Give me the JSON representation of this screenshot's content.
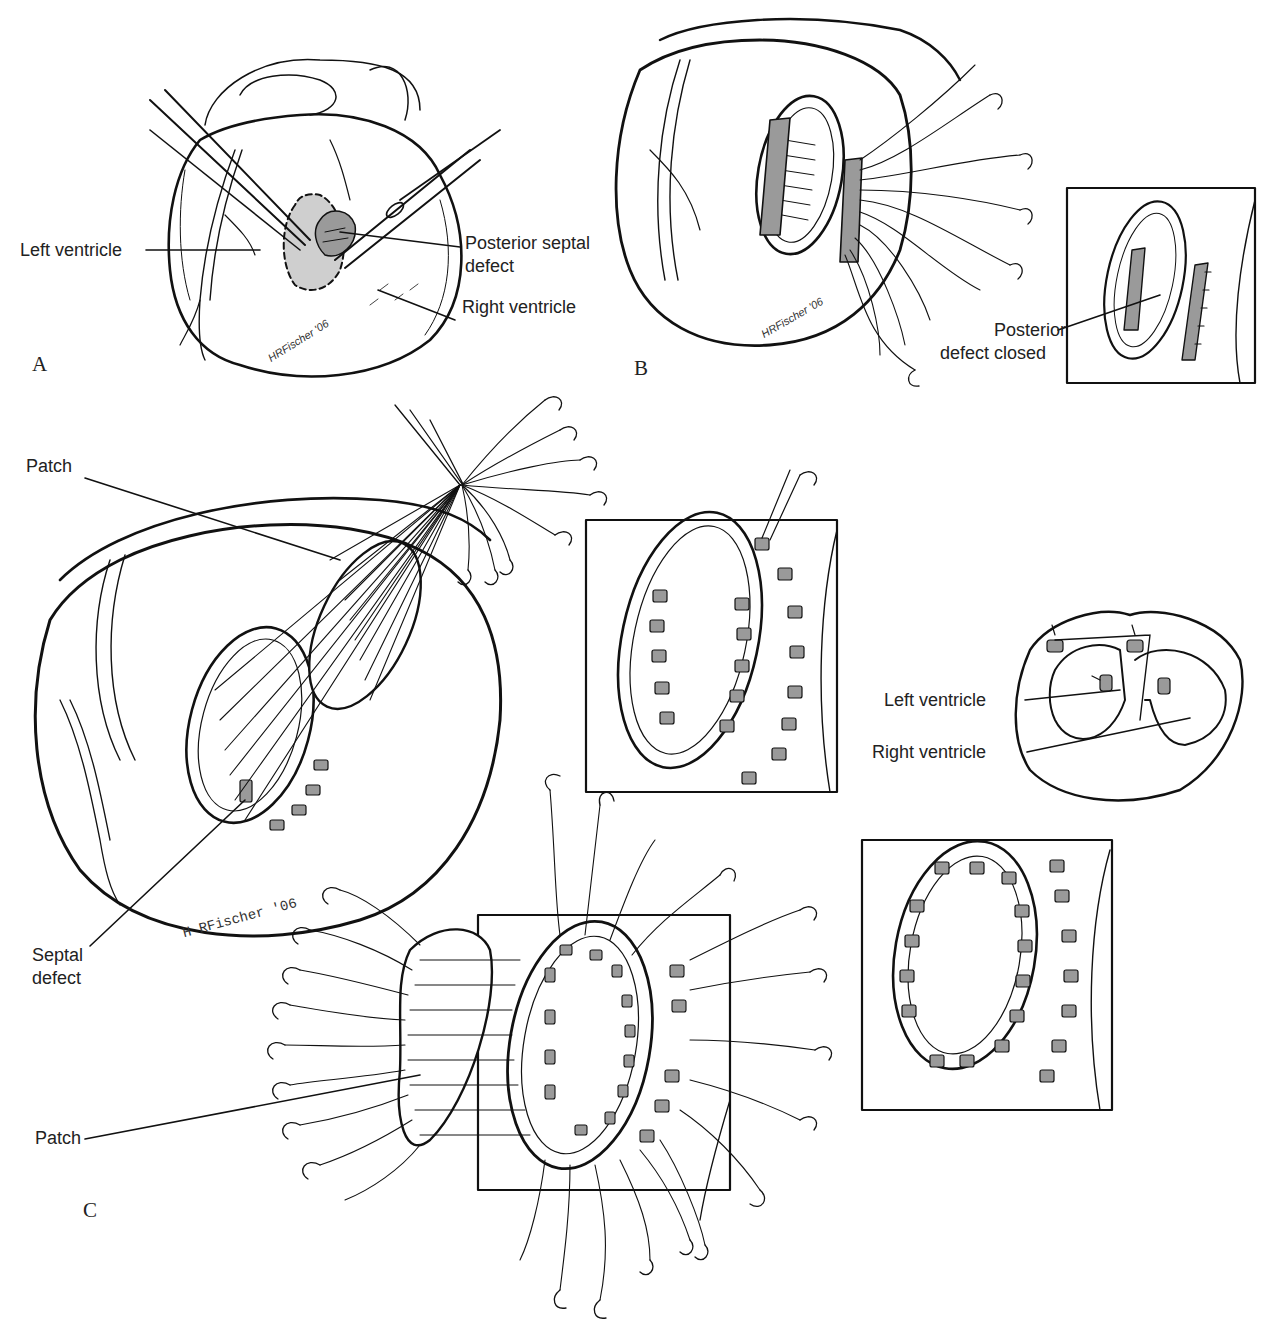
{
  "figure": {
    "panels": [
      {
        "letter": "A",
        "labels": {
          "left_ventricle": "Left ventricle",
          "posterior_septal_defect_line1": "Posterior septal",
          "posterior_septal_defect_line2": "defect",
          "right_ventricle": "Right ventricle"
        },
        "signature": "HRFischer '06"
      },
      {
        "letter": "B",
        "labels": {
          "posterior_defect_closed_line1": "Posterior",
          "posterior_defect_closed_line2": "defect closed"
        },
        "signature": "HRFischer '06"
      },
      {
        "letter": "C",
        "labels": {
          "patch_top": "Patch",
          "septal_defect_line1": "Septal",
          "septal_defect_line2": "defect",
          "patch_bottom": "Patch",
          "left_ventricle": "Left ventricle",
          "right_ventricle": "Right ventricle"
        },
        "signature": "H RFischer '06"
      }
    ]
  }
}
